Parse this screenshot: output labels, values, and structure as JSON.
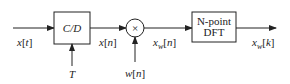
{
  "diagram": {
    "type": "block-diagram",
    "blocks": {
      "cd": {
        "label": "C/D"
      },
      "multiplier": {
        "label": "×"
      },
      "dft": {
        "line1": "N-point",
        "line2": "DFT"
      }
    },
    "signals": {
      "input": "x[t]",
      "sampling_period": "T",
      "sampled": "x[n]",
      "window": "w[n]",
      "windowed": "x_w[n]",
      "output": "x_w[k]"
    },
    "label_parts": {
      "x_t": {
        "base": "x",
        "bracket_open": "[",
        "arg": "t",
        "bracket_close": "]"
      },
      "T": {
        "base": "T"
      },
      "x_n": {
        "base": "x",
        "bracket_open": "[",
        "arg": "n",
        "bracket_close": "]"
      },
      "w_n": {
        "base": "w",
        "bracket_open": "[",
        "arg": "n",
        "bracket_close": "]"
      },
      "xw_n": {
        "base": "x",
        "sub": "w",
        "bracket_open": "[",
        "arg": "n",
        "bracket_close": "]"
      },
      "xw_k": {
        "base": "x",
        "sub": "w",
        "bracket_open": "[",
        "arg": "k",
        "bracket_close": "]"
      }
    }
  }
}
